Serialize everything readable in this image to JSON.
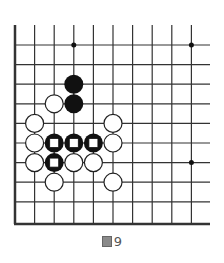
{
  "diagram": {
    "type": "go-board-fragment",
    "grid": {
      "origin_x": 15,
      "origin_y": 45,
      "spacing": 19.6,
      "columns": 10,
      "rows": 9,
      "top_open_y": 25,
      "right_open_x": 210,
      "bottom_edge_y": 224,
      "line_color": "#333333"
    },
    "star_points": [
      [
        3,
        0
      ],
      [
        9,
        0
      ],
      [
        9,
        6
      ]
    ],
    "black_stones": [
      [
        3,
        2
      ],
      [
        3,
        3
      ]
    ],
    "marked_black_stones": [
      [
        2,
        5
      ],
      [
        3,
        5
      ],
      [
        4,
        5
      ],
      [
        2,
        6
      ]
    ],
    "white_stones": [
      [
        2,
        3
      ],
      [
        1,
        4
      ],
      [
        5,
        4
      ],
      [
        1,
        5
      ],
      [
        5,
        5
      ],
      [
        1,
        6
      ],
      [
        3,
        6
      ],
      [
        4,
        6
      ],
      [
        2,
        7
      ],
      [
        5,
        7
      ]
    ],
    "colors": {
      "black": "#111111",
      "white": "#ffffff",
      "marker": "#ffffff"
    }
  },
  "caption": {
    "prefix_icon": "figure-icon",
    "label": "9"
  }
}
